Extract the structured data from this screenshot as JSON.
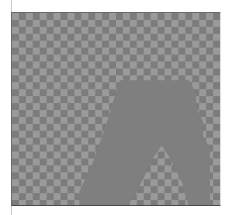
{
  "canvas": {
    "label": "transparency-canvas",
    "checker": {
      "cell_size_px": 7,
      "light_color": "#9a9a9a",
      "dark_color": "#7c7c7c"
    },
    "shape": {
      "name": "arch-shape",
      "fill": "#7f7f7f"
    }
  }
}
